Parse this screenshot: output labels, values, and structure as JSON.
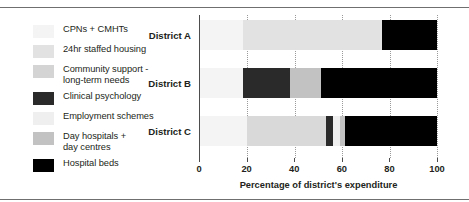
{
  "chart_data": {
    "type": "bar",
    "orientation": "horizontal",
    "stacked": true,
    "normalized": true,
    "title": "",
    "xlabel": "Percentage of district's expenditure",
    "ylabel": "",
    "xlim": [
      0,
      100
    ],
    "xticks": [
      0,
      20,
      40,
      60,
      80,
      100
    ],
    "xtick_labels": [
      "0",
      "20",
      "40",
      "60",
      "80",
      "100"
    ],
    "grid": "vertical-dotted",
    "legend_position": "left",
    "categories": [
      "District A",
      "District B",
      "District C"
    ],
    "series": [
      {
        "name": "CPNs + CMHTs",
        "color": "#f4f4f4",
        "values": [
          18,
          18,
          20
        ]
      },
      {
        "name": "24hr staffed housing",
        "color": "#e2e2e2",
        "values": [
          59,
          0,
          0
        ]
      },
      {
        "name": "Community support -\nlong-term needs",
        "color": "#d4d4d4",
        "values": [
          0,
          0,
          33
        ]
      },
      {
        "name": "Clinical psychology",
        "color": "#2a2a2a",
        "values": [
          0,
          20,
          3
        ]
      },
      {
        "name": "Employment schemes",
        "color": "#efefef",
        "values": [
          0,
          0,
          3
        ]
      },
      {
        "name": "Day hospitals +\nday centres",
        "color": "#c2c2c2",
        "values": [
          0,
          13,
          2
        ]
      },
      {
        "name": "Hospital beds",
        "color": "#000000",
        "values": [
          23,
          49,
          39
        ]
      }
    ],
    "bars": [
      {
        "category": "District A",
        "segments": [
          {
            "series": "CPNs + CMHTs",
            "value": 18,
            "color": "#f4f4f4"
          },
          {
            "series": "24hr staffed housing",
            "value": 59,
            "color": "#e2e2e2"
          },
          {
            "series": "Day hospitals + day centres",
            "value": 0,
            "color": "#c2c2c2"
          },
          {
            "series": "Hospital beds",
            "value": 23,
            "color": "#000000"
          }
        ]
      },
      {
        "category": "District B",
        "segments": [
          {
            "series": "CPNs + CMHTs",
            "value": 18,
            "color": "#f4f4f4"
          },
          {
            "series": "Clinical psychology",
            "value": 20,
            "color": "#2a2a2a"
          },
          {
            "series": "Day hospitals + day centres",
            "value": 13,
            "color": "#c2c2c2"
          },
          {
            "series": "Hospital beds",
            "value": 49,
            "color": "#000000"
          }
        ]
      },
      {
        "category": "District C",
        "segments": [
          {
            "series": "CPNs + CMHTs",
            "value": 20,
            "color": "#f4f4f4"
          },
          {
            "series": "Community support - long-term needs",
            "value": 33,
            "color": "#d9d9d9"
          },
          {
            "series": "Clinical psychology",
            "value": 3,
            "color": "#2a2a2a"
          },
          {
            "series": "Employment schemes",
            "value": 3,
            "color": "#efefef"
          },
          {
            "series": "Day hospitals + day centres",
            "value": 2,
            "color": "#c2c2c2"
          },
          {
            "series": "Hospital beds",
            "value": 39,
            "color": "#000000"
          }
        ]
      }
    ]
  },
  "legend": {
    "items": [
      {
        "label": "CPNs + CMHTs",
        "color": "#f4f4f4"
      },
      {
        "label": "24hr staffed housing",
        "color": "#e2e2e2"
      },
      {
        "label": "Community support -\nlong-term needs",
        "color": "#d4d4d4"
      },
      {
        "label": "Clinical psychology",
        "color": "#2a2a2a"
      },
      {
        "label": "Employment schemes",
        "color": "#efefef"
      },
      {
        "label": "Day hospitals +\nday centres",
        "color": "#c2c2c2"
      },
      {
        "label": "Hospital beds",
        "color": "#000000"
      }
    ]
  },
  "axis": {
    "xlabel": "Percentage of district's expenditure",
    "ticks": [
      "0",
      "20",
      "40",
      "60",
      "80",
      "100"
    ]
  },
  "bar_labels": [
    "District A",
    "District B",
    "District C"
  ]
}
